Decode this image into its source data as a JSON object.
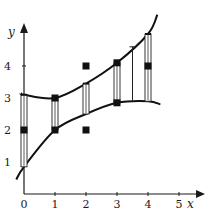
{
  "chart_data": {
    "type": "scatter",
    "title": "",
    "xlabel": "x",
    "ylabel": "y",
    "xlim": [
      0,
      5.5
    ],
    "ylim": [
      0,
      5.3
    ],
    "x_ticks": [
      "0",
      "1",
      "2",
      "3",
      "4",
      "5"
    ],
    "y_ticks": [
      "1",
      "2",
      "3",
      "4"
    ],
    "grid": false,
    "legend": "none",
    "points": [
      {
        "x": 0,
        "y": 2.0
      },
      {
        "x": 1,
        "y": 3.0
      },
      {
        "x": 1,
        "y": 2.0
      },
      {
        "x": 2,
        "y": 4.0
      },
      {
        "x": 2,
        "y": 2.0
      },
      {
        "x": 3,
        "y": 4.1
      },
      {
        "x": 3,
        "y": 2.85
      },
      {
        "x": 4,
        "y": 4.0
      }
    ],
    "intervals": [
      {
        "x": 0,
        "low": 0.85,
        "high": 3.1,
        "style": "bar"
      },
      {
        "x": 1,
        "low": 2.0,
        "high": 3.0,
        "style": "bar"
      },
      {
        "x": 2,
        "low": 2.5,
        "high": 3.45,
        "style": "bar"
      },
      {
        "x": 3,
        "low": 2.85,
        "high": 4.1,
        "style": "bar"
      },
      {
        "x": 3.5,
        "low": 2.9,
        "high": 4.6,
        "style": "line"
      },
      {
        "x": 4,
        "low": 2.9,
        "high": 5.0,
        "style": "bar"
      }
    ],
    "series": [
      {
        "name": "upper-band",
        "x": [
          -0.1,
          0,
          1,
          2,
          3,
          4,
          4.3
        ],
        "y": [
          3.15,
          3.1,
          3.0,
          3.45,
          4.1,
          5.0,
          5.6
        ]
      },
      {
        "name": "lower-band",
        "x": [
          -0.25,
          0,
          1,
          2,
          3,
          4,
          4.4
        ],
        "y": [
          0.45,
          0.85,
          2.0,
          2.5,
          2.85,
          2.9,
          2.8
        ]
      }
    ]
  }
}
